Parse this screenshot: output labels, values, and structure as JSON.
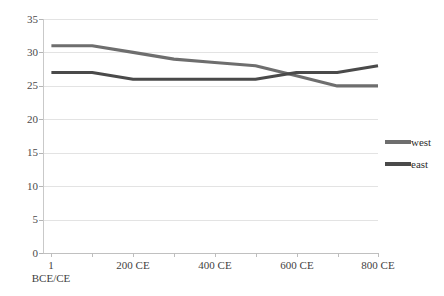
{
  "chart_data": {
    "type": "line",
    "title": "",
    "xlabel": "",
    "ylabel": "",
    "x": [
      1,
      100,
      200,
      300,
      400,
      500,
      600,
      700,
      800
    ],
    "categories": [
      "1 BCE/CE",
      "100 CE",
      "200 CE",
      "300 CE",
      "400 CE",
      "500 CE",
      "600 CE",
      "700 CE",
      "800 CE"
    ],
    "series": [
      {
        "name": "west",
        "color": "#6e6e6e",
        "values": [
          31,
          31,
          30,
          29,
          28.5,
          28,
          26.5,
          25,
          25
        ]
      },
      {
        "name": "east",
        "color": "#4a4a4a",
        "values": [
          27,
          27,
          26,
          26,
          26,
          26,
          27,
          27,
          28
        ]
      }
    ],
    "ylim": [
      0,
      35
    ],
    "xlim": [
      1,
      800
    ],
    "yticks": [
      0,
      5,
      10,
      15,
      20,
      25,
      30,
      35
    ],
    "ytick_labels": [
      "0",
      "5",
      "10",
      "15",
      "20",
      "25",
      "30",
      "35"
    ],
    "xtick_values": [
      1,
      200,
      400,
      600,
      800
    ],
    "xtick_labels": [
      "1",
      "200 CE",
      "400 CE",
      "600 CE",
      "800 CE"
    ],
    "xtick_sublabels": [
      "BCE/CE",
      "",
      "",
      "",
      ""
    ],
    "grid": true,
    "grid_color": "#e3e3e3",
    "legend_position": "right",
    "legend_entries": [
      "west",
      "east"
    ],
    "background": "#ffffff"
  }
}
